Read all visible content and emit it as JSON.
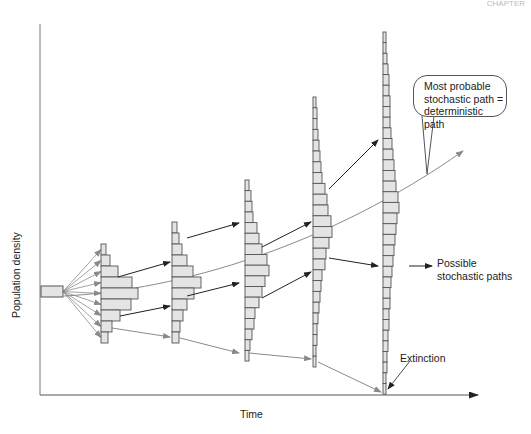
{
  "header": {
    "corner_text": "CHAPTER"
  },
  "axes": {
    "y_label": "Population density",
    "x_label": "Time"
  },
  "annotations": {
    "callout": [
      "Most probable",
      "stochastic path =",
      "deterministic path"
    ],
    "possible_paths": [
      "Possible",
      "stochastic  paths"
    ],
    "extinction": "Extinction"
  },
  "colors": {
    "bar_fill": "#e4e4e4",
    "bar_stroke": "#555555",
    "black_arrow": "#222222",
    "gray_arrow": "#8a8a8a",
    "axis": "#555555"
  },
  "chart_data": {
    "type": "diagram",
    "xlabel": "Time",
    "ylabel": "Population density",
    "start_box": {
      "x": 41,
      "y": 286,
      "w": 22,
      "h": 11
    },
    "histograms": [
      {
        "x": 101,
        "top": 244,
        "bar_h": 11,
        "widths": [
          5,
          9,
          17,
          31,
          37,
          30,
          19,
          11,
          7
        ]
      },
      {
        "x": 172,
        "top": 222,
        "bar_h": 11,
        "widths": [
          5,
          7,
          10,
          15,
          21,
          29,
          22,
          15,
          11,
          8,
          7
        ]
      },
      {
        "x": 245,
        "top": 180,
        "bar_h": 10.65,
        "widths": [
          4,
          6,
          7,
          8,
          12,
          14,
          17,
          22,
          24,
          20,
          17,
          14,
          10,
          9,
          7,
          5,
          4
        ]
      },
      {
        "x": 313,
        "top": 97,
        "bar_h": 10.8,
        "widths": [
          3,
          4,
          4,
          5,
          6,
          7,
          8,
          9,
          12,
          14,
          15,
          18,
          19,
          16,
          13,
          12,
          9,
          8,
          7,
          6,
          5,
          4,
          4,
          3,
          3
        ]
      },
      {
        "x": 383,
        "top": 32,
        "bar_h": 10.65,
        "widths": [
          3,
          3,
          4,
          5,
          6,
          6,
          7,
          7,
          7,
          8,
          9,
          10,
          11,
          12,
          13,
          15,
          16,
          14,
          13,
          12,
          11,
          10,
          9,
          8,
          7,
          7,
          6,
          6,
          5,
          5,
          4,
          4,
          3,
          3
        ]
      }
    ],
    "black_arrows": [
      [
        118,
        277,
        170,
        262
      ],
      [
        120,
        316,
        170,
        306
      ],
      [
        187,
        238,
        239,
        223
      ],
      [
        187,
        296,
        239,
        283
      ],
      [
        262,
        247,
        311,
        222
      ],
      [
        262,
        298,
        311,
        272
      ],
      [
        329,
        189,
        378,
        140
      ],
      [
        329,
        258,
        378,
        266
      ],
      [
        409,
        266,
        432,
        266
      ]
    ],
    "gray_arrows": [
      [
        112,
        328,
        170,
        337
      ],
      [
        180,
        338,
        239,
        353
      ],
      [
        249,
        353,
        311,
        359
      ],
      [
        318,
        362,
        381,
        392
      ]
    ],
    "deterministic_curve": {
      "from": [
        64,
        296
      ],
      "to": [
        463,
        151
      ]
    }
  }
}
